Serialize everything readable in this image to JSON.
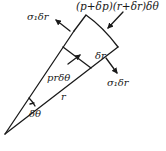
{
  "diagram": {
    "type": "free-body diagram",
    "labels": {
      "outer_force": "(p+δp)(r+δr)δθ",
      "hoop_force_top": "σ₁δr",
      "hoop_force_bottom": "σ₁δr",
      "inner_force": "prδθ",
      "radial_thickness": "δr",
      "radius": "r",
      "angle": "δθ"
    },
    "colors": {
      "ink": "#1a1a1a",
      "background": "#ffffff"
    }
  }
}
